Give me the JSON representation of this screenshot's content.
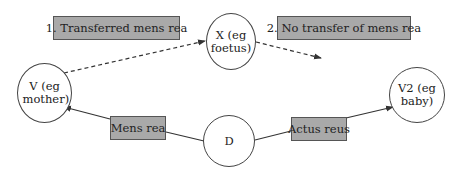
{
  "diagram": {
    "nodes": {
      "v": "V (eg mother)",
      "x": "X (eg foetus)",
      "d": "D",
      "v2": "V2 (eg baby)"
    },
    "labels": {
      "transferred": "1. Transferred mens rea",
      "no_transfer": "2. No transfer of mens rea",
      "mens_rea": "Mens rea",
      "actus_reus": "Actus reus"
    },
    "edges": [
      {
        "from": "V",
        "to": "X",
        "style": "dashed",
        "label": "1. Transferred mens rea"
      },
      {
        "from": "X",
        "to": "(none)",
        "style": "dashed",
        "label": "2. No transfer of mens rea"
      },
      {
        "from": "D",
        "to": "V",
        "style": "solid",
        "label": "Mens rea"
      },
      {
        "from": "D",
        "to": "V2",
        "style": "solid",
        "label": "Actus reus"
      }
    ],
    "colors": {
      "label_fill": "#a9a9a9",
      "line": "#333333"
    }
  }
}
